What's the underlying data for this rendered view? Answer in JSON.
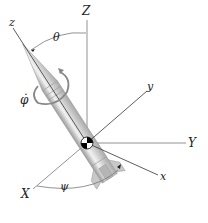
{
  "diagram": {
    "axes": {
      "Z_label": "Z",
      "Y_label": "Y",
      "X_label": "X",
      "z_label": "z",
      "y_label": "y",
      "x_label": "x"
    },
    "angles": {
      "theta_label": "θ",
      "psi_label": "ψ",
      "phi_dot_label": "φ̇"
    },
    "colors": {
      "axis_line": "#555555",
      "body_axis_line": "#333333",
      "rocket_body": "#cfcfcf",
      "rocket_highlight": "#f2f2f2",
      "cg_marker": "#000000"
    }
  }
}
